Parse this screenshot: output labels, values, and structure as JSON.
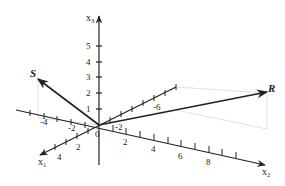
{
  "diagram": {
    "type": "3d-vector-plot",
    "colors": {
      "axis": "#222222",
      "vector": "#222222",
      "projection": "#d8d8d8",
      "background": "#ffffff"
    },
    "axes": {
      "x1": {
        "label": "x",
        "subscript": "1",
        "ticks": [
          "4",
          "2",
          "-2",
          "-6"
        ]
      },
      "x2": {
        "label": "x",
        "subscript": "2",
        "ticks": [
          "-4",
          "-2",
          "2",
          "4",
          "6",
          "8"
        ]
      },
      "x3": {
        "label": "x",
        "subscript": "3",
        "ticks": [
          "1",
          "2",
          "3",
          "4",
          "5"
        ]
      },
      "origin_label": "0"
    },
    "vectors": [
      {
        "name": "S",
        "label": "S"
      },
      {
        "name": "R",
        "label": "R"
      }
    ]
  }
}
